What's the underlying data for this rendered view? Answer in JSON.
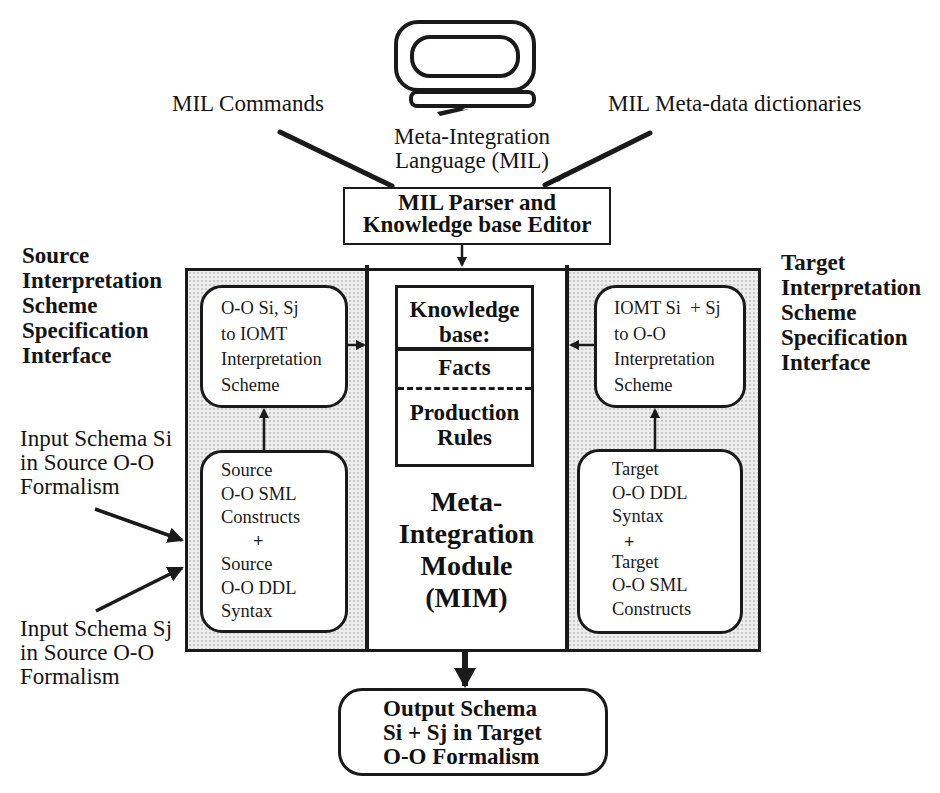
{
  "diagram": {
    "top_labels": {
      "mil_commands": "MIL Commands",
      "mil_metadata": "MIL Meta-data dictionaries",
      "mil_language": [
        "Meta-Integration",
        "Language (MIL)"
      ]
    },
    "parser_box": {
      "lines": [
        "MIL Parser  and",
        "Knowledge base Editor"
      ]
    },
    "source_interface": {
      "lines": [
        "Source",
        "Interpretation",
        "Scheme",
        "Specification",
        "Interface"
      ]
    },
    "target_interface": {
      "lines": [
        "Target",
        "Interpretation",
        "Scheme",
        "Specification",
        "Interface"
      ]
    },
    "input_si": {
      "lines": [
        "Input Schema Si",
        "in Source O-O",
        "Formalism"
      ]
    },
    "input_sj": {
      "lines": [
        "Input Schema Sj",
        "in Source O-O",
        "Formalism"
      ]
    },
    "source_scheme_box": {
      "lines": [
        "O-O Si, Sj",
        "to IOMT",
        "Interpretation",
        "Scheme"
      ]
    },
    "source_constructs_box": {
      "lines": [
        "Source",
        "O-O SML",
        "Constructs",
        "+",
        "Source",
        "O-O DDL",
        "Syntax"
      ]
    },
    "target_scheme_box": {
      "lines": [
        "IOMT Si  + Sj",
        "to O-O",
        "Interpretation",
        "Scheme"
      ]
    },
    "target_constructs_box": {
      "lines": [
        "Target",
        "O-O DDL",
        "Syntax",
        "+",
        "Target",
        "O-O SML",
        "Constructs"
      ]
    },
    "knowledge_base": {
      "title": [
        "Knowledge",
        "base:"
      ],
      "facts": "Facts",
      "rules": [
        "Production",
        "Rules"
      ]
    },
    "mim": {
      "lines": [
        "Meta-",
        "Integration",
        "Module",
        "(MIM)"
      ]
    },
    "output_box": {
      "lines": [
        "Output Schema",
        "Si + Sj in Target",
        "O-O Formalism"
      ]
    },
    "icons": {
      "terminal": "computer-terminal-icon"
    },
    "colors": {
      "line": "#1a1a1a",
      "stipple": "#ededed",
      "background": "#ffffff"
    }
  }
}
